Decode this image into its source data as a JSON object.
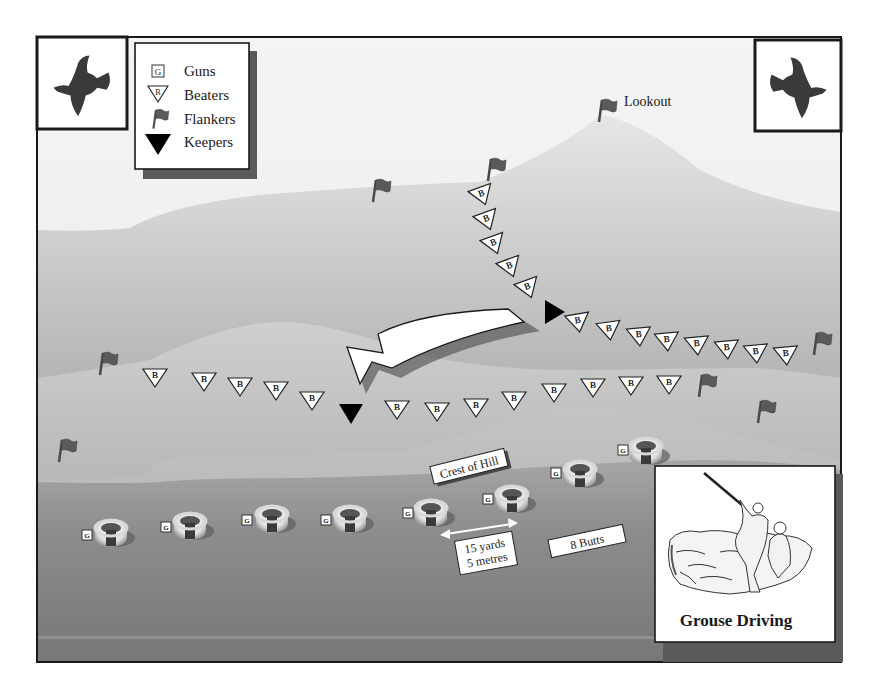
{
  "title": "Grouse Driving",
  "legend": {
    "items": [
      {
        "symbol": "G",
        "icon": "gun-box-icon",
        "label": "Guns"
      },
      {
        "symbol": "B",
        "icon": "beater-triangle-icon",
        "label": "Beaters"
      },
      {
        "symbol": "",
        "icon": "flag-icon",
        "label": "Flankers"
      },
      {
        "symbol": "",
        "icon": "keeper-triangle-icon",
        "label": "Keepers"
      }
    ]
  },
  "labels": {
    "lookout": "Lookout",
    "crest": "Crest of Hill",
    "distance_line1": "15 yards",
    "distance_line2": "5 metres",
    "butts": "8 Butts",
    "inset_caption": "Grouse Driving"
  },
  "symbols": {
    "beater_letter": "B",
    "gun_letter": "G"
  },
  "colors": {
    "sky": "#f2f2f2",
    "hill_far": "#c8c8c8",
    "hill_mid": "#8e8e8e",
    "hill_near": "#b9b9b9",
    "ground": "#7c7c7c",
    "frame": "#1a1a1a",
    "shadow": "#5a5a5a",
    "flag": "#555555",
    "keeper": "#000000"
  },
  "counts": {
    "beaters_upper_line": 15,
    "beaters_lower_line": 15,
    "keepers": 2,
    "flankers": 8,
    "butts": 8
  }
}
